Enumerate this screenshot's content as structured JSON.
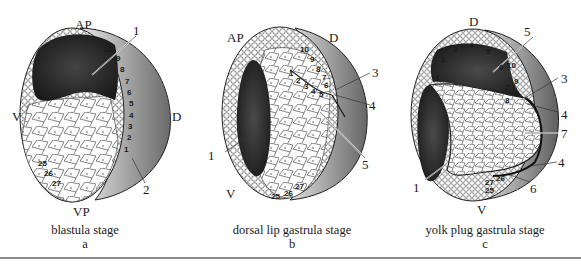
{
  "figure": {
    "panels": [
      {
        "id": "a",
        "caption": "blastula stage",
        "letter": "a",
        "axes": {
          "top": "AP",
          "bottom": "VP",
          "left": "V",
          "right": "D"
        },
        "callouts": [
          "1",
          "2"
        ],
        "cell_numbers": [
          "10",
          "9",
          "8",
          "7",
          "6",
          "5",
          "4",
          "3",
          "2",
          "1",
          "25",
          "26",
          "27"
        ]
      },
      {
        "id": "b",
        "caption": "dorsal lip gastrula stage",
        "letter": "b",
        "axes": {
          "top_left": "AP",
          "top_right": "D",
          "bottom_left": "V"
        },
        "callouts": [
          "1",
          "3",
          "4",
          "5"
        ],
        "cell_numbers": [
          "10",
          "9",
          "8",
          "7",
          "6",
          "5",
          "4",
          "3",
          "2",
          "1",
          "25",
          "26",
          "27"
        ]
      },
      {
        "id": "c",
        "caption": "yolk plug gastrula stage",
        "letter": "c",
        "axes": {
          "top": "D",
          "bottom": "V"
        },
        "callouts": [
          "5",
          "3",
          "4",
          "7",
          "4",
          "6",
          "1"
        ],
        "cell_numbers": [
          "1",
          "2",
          "3",
          "4",
          "5",
          "6",
          "10",
          "9",
          "7",
          "8",
          "26",
          "27",
          "25"
        ]
      }
    ],
    "colors": {
      "ink": "#1a1a1a",
      "dark_fill": "#2b2b2b",
      "shade": "#8c8c8c",
      "light": "#f4f4f4",
      "rule": "#8a8a8a"
    }
  }
}
